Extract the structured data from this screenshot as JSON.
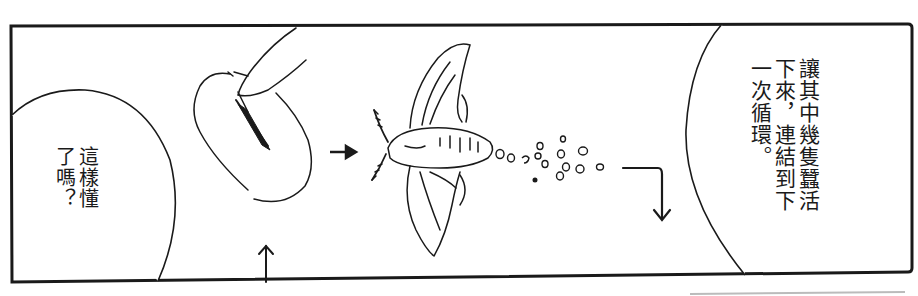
{
  "panel": {
    "border_color": "#1a1a1a",
    "background": "#ffffff"
  },
  "bubbles": {
    "left": {
      "columns": [
        "這樣懂",
        "了嗎？"
      ]
    },
    "right": {
      "columns": [
        "讓其中幾隻蠶活",
        "下來，連結到下",
        "一次循環。"
      ]
    }
  },
  "illustrations": {
    "cocoon": "cocoon-cut-open-by-finger",
    "moth": "silk-moth-laying-eggs",
    "eggs": "egg-cluster",
    "arrows": [
      "arrow-right",
      "arrow-up",
      "arrow-bend-down"
    ]
  }
}
